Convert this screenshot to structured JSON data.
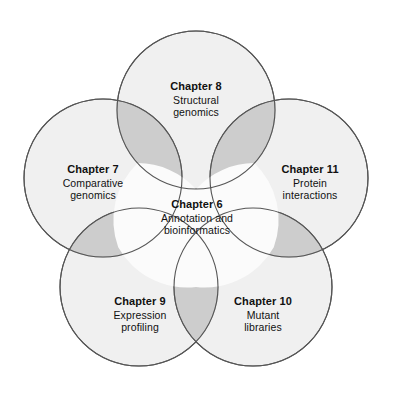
{
  "figure": {
    "type": "venn-flower-diagram",
    "background_color": "#ffffff",
    "circle_fill": "#e6e6e6",
    "circle_stroke": "#555555",
    "pair_overlap_color": "#c4c4c4",
    "triple_overlap_color": "#8f8f8f",
    "center_color": "#fbfbfb"
  },
  "petals": [
    {
      "id": "chapter-8",
      "chapter": "Chapter 8",
      "description": "Structural\ngenomics",
      "description_lines": [
        "Structural",
        "genomics"
      ],
      "position": "top"
    },
    {
      "id": "chapter-7",
      "chapter": "Chapter 7",
      "description": "Comparative\ngenomics",
      "description_lines": [
        "Comparative",
        "genomics"
      ],
      "position": "upper-left"
    },
    {
      "id": "chapter-11",
      "chapter": "Chapter 11",
      "description": "Protein\ninteractions",
      "description_lines": [
        "Protein",
        "interactions"
      ],
      "position": "upper-right"
    },
    {
      "id": "chapter-9",
      "chapter": "Chapter 9",
      "description": "Expression\nprofiling",
      "description_lines": [
        "Expression",
        "profiling"
      ],
      "position": "lower-left"
    },
    {
      "id": "chapter-10",
      "chapter": "Chapter 10",
      "description": "Mutant\nlibraries",
      "description_lines": [
        "Mutant",
        "libraries"
      ],
      "position": "lower-right"
    }
  ],
  "center": {
    "id": "chapter-6",
    "chapter": "Chapter 6",
    "description": "Annotation and\nbioinformatics",
    "description_lines": [
      "Annotation and",
      "bioinformatics"
    ],
    "position": "center"
  }
}
